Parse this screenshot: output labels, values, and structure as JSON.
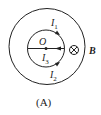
{
  "figure": {
    "caption": "(A)",
    "center_label": "O",
    "field_label": "B",
    "field_symbol": "into-page",
    "currents": [
      {
        "name": "I",
        "sub": "1"
      },
      {
        "name": "I",
        "sub": "2"
      },
      {
        "name": "I",
        "sub": "3"
      }
    ],
    "colors": {
      "stroke": "#222222",
      "background": "#ffffff"
    }
  }
}
